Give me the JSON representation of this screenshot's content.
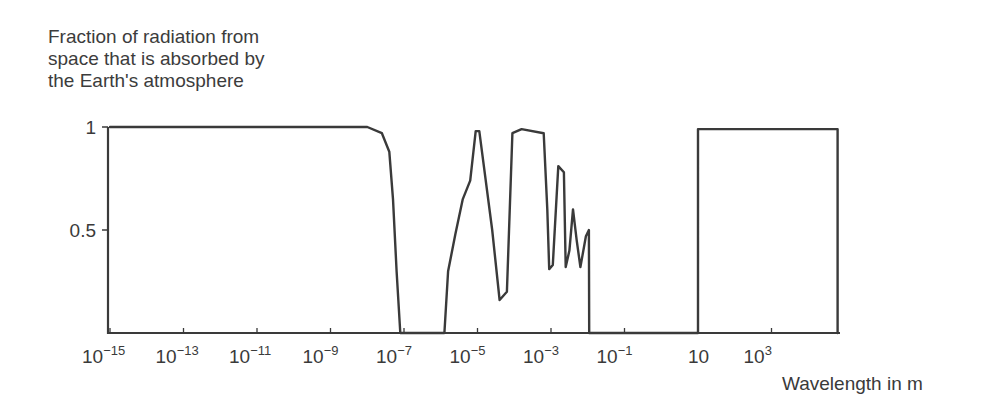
{
  "chart_data": {
    "type": "line",
    "title": "",
    "ylabel": [
      "Fraction of radiation from",
      "space that is absorbed by",
      "the Earth's atmosphere"
    ],
    "xlabel": "Wavelength in m",
    "xscale": "log",
    "xlim_log10": [
      -15,
      5
    ],
    "ylim": [
      0,
      1
    ],
    "y_ticks": [
      {
        "value": 0.5,
        "label": "0.5"
      },
      {
        "value": 1,
        "label": "1"
      }
    ],
    "x_ticks": [
      {
        "log10": -15,
        "base": "10",
        "exp": "−15"
      },
      {
        "log10": -13,
        "base": "10",
        "exp": "−13"
      },
      {
        "log10": -11,
        "base": "10",
        "exp": "−11"
      },
      {
        "log10": -9,
        "base": "10",
        "exp": "−9"
      },
      {
        "log10": -7,
        "base": "10",
        "exp": "−7"
      },
      {
        "log10": -5,
        "base": "10",
        "exp": "−5"
      },
      {
        "log10": -3,
        "base": "10",
        "exp": "−3"
      },
      {
        "log10": -1,
        "base": "10",
        "exp": "−1"
      },
      {
        "log10": 1,
        "base": "10",
        "exp": ""
      },
      {
        "log10": 3,
        "base": "10",
        "exp": "3"
      }
    ],
    "grid": false,
    "series": [
      {
        "name": "Absorbed fraction",
        "points_log10_lambda_vs_fraction": [
          [
            -15,
            1.0
          ],
          [
            -8.0,
            1.0
          ],
          [
            -7.6,
            0.97
          ],
          [
            -7.4,
            0.88
          ],
          [
            -7.3,
            0.65
          ],
          [
            -7.2,
            0.3
          ],
          [
            -7.1,
            0.0
          ],
          [
            -5.9,
            0.0
          ],
          [
            -5.8,
            0.3
          ],
          [
            -5.6,
            0.48
          ],
          [
            -5.4,
            0.65
          ],
          [
            -5.2,
            0.74
          ],
          [
            -5.05,
            0.98
          ],
          [
            -4.95,
            0.98
          ],
          [
            -4.6,
            0.5
          ],
          [
            -4.4,
            0.16
          ],
          [
            -4.2,
            0.2
          ],
          [
            -4.05,
            0.97
          ],
          [
            -3.8,
            0.99
          ],
          [
            -3.2,
            0.97
          ],
          [
            -3.1,
            0.6
          ],
          [
            -3.05,
            0.31
          ],
          [
            -2.95,
            0.33
          ],
          [
            -2.8,
            0.81
          ],
          [
            -2.65,
            0.78
          ],
          [
            -2.6,
            0.32
          ],
          [
            -2.5,
            0.4
          ],
          [
            -2.4,
            0.6
          ],
          [
            -2.3,
            0.45
          ],
          [
            -2.2,
            0.32
          ],
          [
            -2.05,
            0.47
          ],
          [
            -1.97,
            0.5
          ],
          [
            -1.96,
            0.0
          ],
          [
            1.0,
            0.0
          ],
          [
            1.0,
            0.99
          ],
          [
            4.8,
            0.99
          ],
          [
            4.8,
            0.0
          ]
        ]
      }
    ],
    "annotations": []
  }
}
